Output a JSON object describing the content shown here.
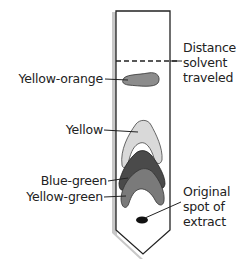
{
  "diagram": {
    "type": "paper chromatography strip",
    "colors": {
      "strip_outline": "#222222",
      "strip_shadow": "#bdbdbd",
      "yellow_orange": "#8c8c8c",
      "yellow": "#d9d9d9",
      "blue_green": "#4a4a4a",
      "yellow_green": "#7a7a7a",
      "spot": "#111111"
    },
    "labels": {
      "solvent_line": [
        "Distance",
        "solvent",
        "traveled"
      ],
      "yellow_orange": "Yellow-orange",
      "yellow": "Yellow",
      "blue_green": "Blue-green",
      "yellow_green": "Yellow-green",
      "origin": [
        "Original",
        "spot of",
        "extract"
      ]
    }
  }
}
